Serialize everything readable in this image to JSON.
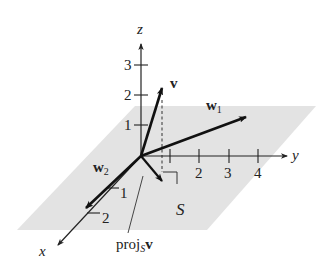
{
  "figure": {
    "type": "3d-coordinate-diagram",
    "colors": {
      "plane": "#e3e3e3",
      "axis": "#222222",
      "vector": "#111111",
      "text": "#222222"
    },
    "axes": {
      "z": {
        "label": "z",
        "ticks": [
          "1",
          "2",
          "3"
        ]
      },
      "y": {
        "label": "y",
        "ticks": [
          "2",
          "3",
          "4"
        ]
      },
      "x": {
        "label": "x",
        "ticks": [
          "1",
          "2"
        ]
      }
    },
    "plane": {
      "label": "S"
    },
    "vectors": {
      "v": {
        "label": "v"
      },
      "w1": {
        "label": "w",
        "subscript": "1"
      },
      "w2": {
        "label": "w",
        "subscript": "2"
      },
      "proj": {
        "label": "proj",
        "subscript": "S",
        "suffix": "v"
      }
    }
  }
}
